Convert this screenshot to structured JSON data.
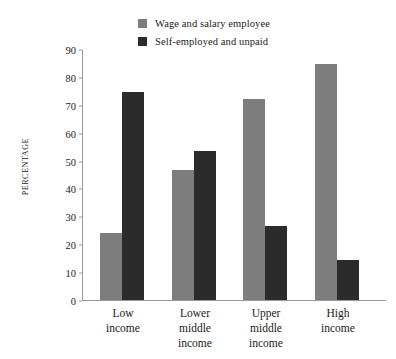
{
  "chart_data": {
    "type": "bar",
    "title": "",
    "subtitle": "",
    "xlabel": "",
    "ylabel": "PERCENTAGE",
    "ylim": [
      0,
      90
    ],
    "yticks": [
      0,
      10,
      20,
      30,
      40,
      50,
      60,
      70,
      80,
      90
    ],
    "grid": false,
    "legend_position": "top-center",
    "categories": [
      "Low\nincome",
      "Lower\nmiddle\nincome",
      "Upper\nmiddle\nincome",
      "High\nincome"
    ],
    "category_lines": [
      [
        "Low",
        "income"
      ],
      [
        "Lower",
        "middle",
        "income"
      ],
      [
        "Upper",
        "middle",
        "income"
      ],
      [
        "High",
        "income"
      ]
    ],
    "series": [
      {
        "name": "Wage and salary employee",
        "color": "#7d7d7d",
        "values": [
          24,
          46.5,
          72,
          84.5
        ]
      },
      {
        "name": "Self-employed and unpaid",
        "color": "#2b2b2b",
        "values": [
          74.5,
          53.5,
          26.5,
          14.5
        ]
      }
    ]
  },
  "legend": {
    "entries": [
      {
        "label": "Wage and salary employee",
        "color": "#7d7d7d"
      },
      {
        "label": "Self-employed and unpaid",
        "color": "#2b2b2b"
      }
    ]
  },
  "axis": {
    "y_title": "PERCENTAGE",
    "axis_color": "#9a9a9a"
  }
}
